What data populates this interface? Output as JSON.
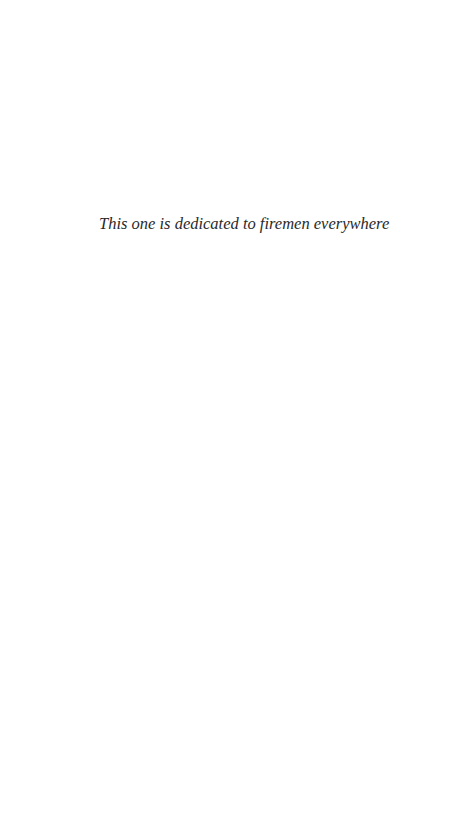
{
  "page": {
    "type": "dedication",
    "dedication_text": "This one is dedicated to firemen everywhere"
  },
  "colors": {
    "background": "#ffffff",
    "text": "#2a2a2a"
  }
}
